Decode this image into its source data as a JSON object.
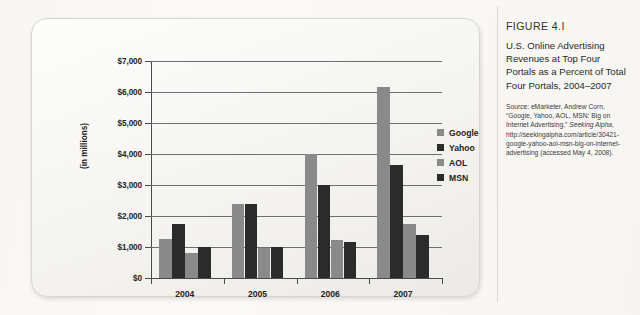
{
  "figure": {
    "number": "FIGURE 4.I",
    "title": "U.S. Online Advertising Revenues at Top Four Portals as a Percent of Total Four Portals, 2004–2007",
    "source_prefix": "Source: eMarketer, Andrew Corn, “Google, Yahoo, AOL, MSN: Big on Internet Advertising,” ",
    "source_publication": "Seeking Alpha",
    "source_suffix": ", http://seekingalpha.com/article/30421-google-yahoo-aol-msn-big-on-internet-advertising (accessed May 4, 2008)."
  },
  "chart_data": {
    "type": "bar",
    "title": "",
    "xlabel": "",
    "ylabel": "(in millions)",
    "categories": [
      "2004",
      "2005",
      "2006",
      "2007"
    ],
    "series": [
      {
        "name": "Google",
        "color": "#8a8a8a",
        "values": [
          1250,
          2400,
          4000,
          6150
        ]
      },
      {
        "name": "Yahoo",
        "color": "#2b2b2b",
        "values": [
          1750,
          2400,
          3000,
          3650
        ]
      },
      {
        "name": "AOL",
        "color": "#8a8a8a",
        "values": [
          800,
          980,
          1220,
          1750
        ]
      },
      {
        "name": "MSN",
        "color": "#2b2b2b",
        "values": [
          1000,
          1010,
          1150,
          1400
        ]
      }
    ],
    "ylim": [
      0,
      7000
    ],
    "ytick_values": [
      0,
      1000,
      2000,
      3000,
      4000,
      5000,
      6000,
      7000
    ],
    "ytick_labels": [
      "$0",
      "$1,000",
      "$2,000",
      "$3,000",
      "$4,000",
      "$5,000",
      "$6,000",
      "$7,000"
    ],
    "grid": true,
    "legend_position": "right"
  }
}
